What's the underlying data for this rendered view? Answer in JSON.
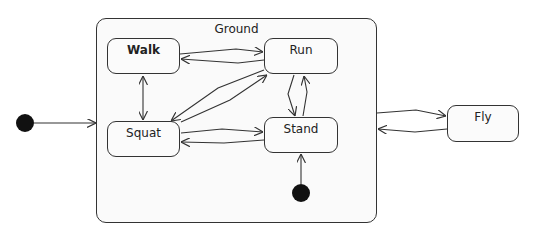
{
  "diagram": {
    "type": "uml-state-machine",
    "composite": {
      "label": "Ground",
      "x": 96,
      "y": 18,
      "w": 281,
      "h": 205
    },
    "states": [
      {
        "id": "walk",
        "label": "Walk",
        "x": 107,
        "y": 38,
        "w": 73,
        "h": 36
      },
      {
        "id": "run",
        "label": "Run",
        "x": 264,
        "y": 38,
        "w": 74,
        "h": 36
      },
      {
        "id": "squat",
        "label": "Squat",
        "x": 107,
        "y": 121,
        "w": 73,
        "h": 36
      },
      {
        "id": "stand",
        "label": "Stand",
        "x": 264,
        "y": 117,
        "w": 74,
        "h": 36
      },
      {
        "id": "fly",
        "label": "Fly",
        "x": 447,
        "y": 105,
        "w": 72,
        "h": 37
      }
    ],
    "initial_nodes": [
      {
        "id": "outer-initial",
        "cx": 25,
        "cy": 123,
        "r": 9
      },
      {
        "id": "ground-initial",
        "cx": 301,
        "cy": 193,
        "r": 9
      }
    ],
    "transitions": [
      {
        "from": "outer-initial",
        "to": "Ground"
      },
      {
        "from": "ground-initial",
        "to": "Stand"
      },
      {
        "from": "Walk",
        "to": "Run"
      },
      {
        "from": "Run",
        "to": "Walk"
      },
      {
        "from": "Walk",
        "to": "Squat"
      },
      {
        "from": "Squat",
        "to": "Walk"
      },
      {
        "from": "Run",
        "to": "Squat"
      },
      {
        "from": "Squat",
        "to": "Run"
      },
      {
        "from": "Squat",
        "to": "Stand"
      },
      {
        "from": "Stand",
        "to": "Squat"
      },
      {
        "from": "Run",
        "to": "Stand"
      },
      {
        "from": "Stand",
        "to": "Run"
      },
      {
        "from": "Ground",
        "to": "Fly"
      },
      {
        "from": "Fly",
        "to": "Ground"
      }
    ],
    "colors": {
      "line": "#333333",
      "fill": "#fafafa",
      "initial": "#111111"
    }
  }
}
